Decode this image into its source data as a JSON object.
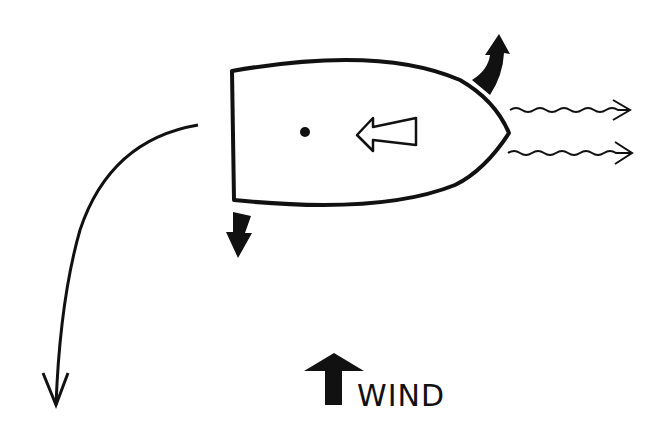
{
  "diagram": {
    "wind_label": "WIND",
    "colors": {
      "ink": "#111111",
      "background": "#ffffff"
    },
    "elements": [
      {
        "name": "boat-hull",
        "description": "boat outline, bow pointing right"
      },
      {
        "name": "pivot-point",
        "description": "dot near stern"
      },
      {
        "name": "thrust-arrow",
        "description": "hollow arrow pointing left (reverse thrust)"
      },
      {
        "name": "bow-movement-arrow",
        "description": "bold arrow at bow pointing up"
      },
      {
        "name": "stern-movement-arrow",
        "description": "bold arrow at stern pointing down"
      },
      {
        "name": "prop-wash-arrows",
        "description": "two wavy arrows pointing right from bow"
      },
      {
        "name": "turning-path-arrow",
        "description": "curved path arrow sweeping down on left"
      },
      {
        "name": "wind-arrow",
        "description": "bold arrow pointing up, labeled WIND"
      }
    ]
  }
}
